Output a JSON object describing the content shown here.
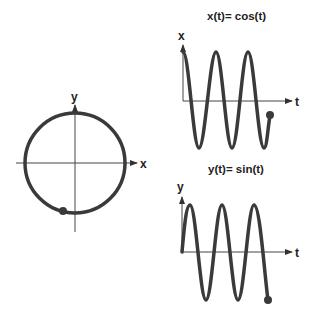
{
  "circle_plot": {
    "x_label": "x",
    "y_label": "y",
    "center": [
      75,
      163
    ],
    "radius": 50,
    "point_angle_deg": 250
  },
  "cos_plot": {
    "title": "x(t)= cos(t)",
    "y_label": "x",
    "t_label": "t"
  },
  "sin_plot": {
    "title": "y(t)= sin(t)",
    "y_label": "y",
    "t_label": "t"
  },
  "colors": {
    "curve": "#3a3a3a",
    "axis": "#444444",
    "text": "#222222"
  }
}
